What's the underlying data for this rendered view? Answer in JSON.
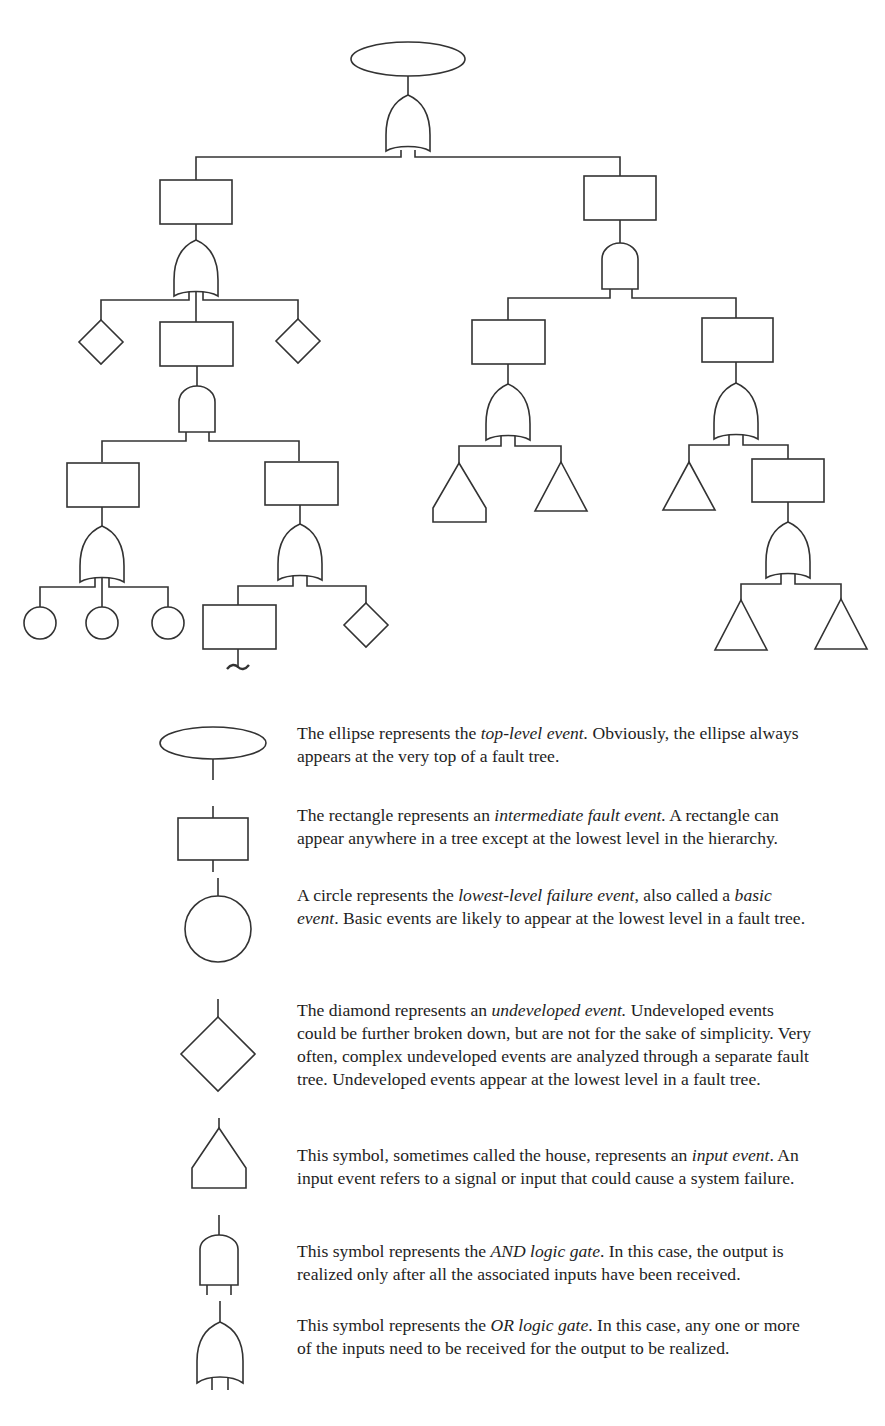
{
  "figure": {
    "type": "fault-tree"
  },
  "tree": {
    "root": {
      "symbol": "ellipse",
      "label": "top-level event",
      "gate": "OR",
      "children": [
        {
          "symbol": "rectangle",
          "gate": "OR",
          "children": [
            {
              "symbol": "diamond"
            },
            {
              "symbol": "rectangle",
              "gate": "AND",
              "children": [
                {
                  "symbol": "rectangle",
                  "gate": "OR",
                  "children": [
                    {
                      "symbol": "circle"
                    },
                    {
                      "symbol": "circle"
                    },
                    {
                      "symbol": "circle"
                    }
                  ]
                },
                {
                  "symbol": "rectangle",
                  "gate": "OR",
                  "children": [
                    {
                      "symbol": "rectangle",
                      "continuation": "~"
                    },
                    {
                      "symbol": "diamond"
                    }
                  ]
                }
              ]
            },
            {
              "symbol": "diamond"
            }
          ]
        },
        {
          "symbol": "rectangle",
          "gate": "AND",
          "children": [
            {
              "symbol": "rectangle",
              "gate": "OR",
              "children": [
                {
                  "symbol": "house"
                },
                {
                  "symbol": "triangle"
                }
              ]
            },
            {
              "symbol": "rectangle",
              "gate": "OR",
              "children": [
                {
                  "symbol": "triangle"
                },
                {
                  "symbol": "rectangle",
                  "gate": "OR",
                  "children": [
                    {
                      "symbol": "triangle"
                    },
                    {
                      "symbol": "triangle"
                    }
                  ]
                }
              ]
            }
          ]
        }
      ]
    }
  },
  "legend": {
    "items": [
      {
        "symbol": "ellipse",
        "pre": "The ellipse represents the ",
        "em": "top-level event.",
        "post": " Obviously, the ellipse always appears at the very top of a fault tree."
      },
      {
        "symbol": "rectangle",
        "pre": "The rectangle represents an ",
        "em": "intermediate fault event.",
        "post": " A rectangle can appear anywhere in a tree except at the lowest level in the hierarchy."
      },
      {
        "symbol": "circle",
        "pre": "A circle represents the ",
        "em": "lowest-level failure event",
        "mid": ", also called a ",
        "em2": "basic event",
        "post": ". Basic events are likely to appear at the lowest level in a fault tree."
      },
      {
        "symbol": "diamond",
        "pre": "The diamond represents an ",
        "em": "undeveloped event.",
        "post": " Undeveloped events could be further broken down, but are not for the sake of simplicity. Very often, complex undeveloped events are analyzed through a separate fault tree. Undeveloped events appear at the lowest level in a fault tree."
      },
      {
        "symbol": "house",
        "pre": "This symbol, sometimes called the house, represents an ",
        "em": "input event",
        "post": ". An input event refers to a signal or input that could cause a system failure."
      },
      {
        "symbol": "and-gate",
        "pre": "This symbol represents the ",
        "em": "AND logic gate",
        "post": ". In this case, the output is realized only after all the associated inputs have been received."
      },
      {
        "symbol": "or-gate",
        "pre": "This symbol represents the ",
        "em": "OR logic gate",
        "post": ". In this case, any one or more of the inputs need to be received for the output to be realized."
      }
    ]
  },
  "colors": {
    "stroke": "#333333",
    "text": "#1e1e1e",
    "background": "#ffffff"
  }
}
